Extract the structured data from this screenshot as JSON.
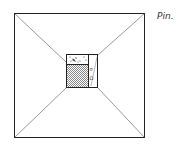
{
  "diagram": {
    "label": "Pin.",
    "colors": {
      "stroke": "#222222",
      "fill_shaded": "#bbbbbb",
      "background": "#ffffff"
    },
    "inner_marks": [
      "σ",
      "Ω"
    ]
  }
}
